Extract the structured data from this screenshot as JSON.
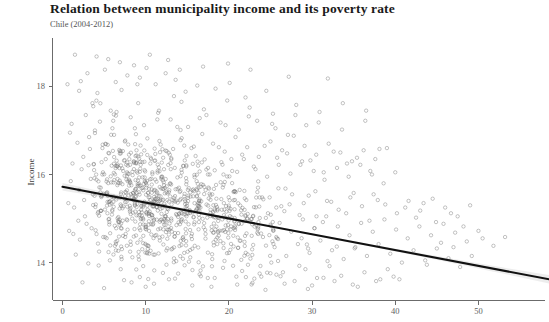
{
  "title": "Relation between municipality income and its poverty rate",
  "subtitle": "Chile (2004-2012)",
  "colors": {
    "point_stroke": "#6f6f6f",
    "fit_line": "#111111",
    "ci_band": "#8c8c8c",
    "axis": "#6b6b6b",
    "title_text": "#1a1a1a",
    "background": "#ffffff"
  },
  "axis_labels": {
    "y_title": "Income",
    "x_title": ""
  },
  "ticks": {
    "x": [
      "0",
      "10",
      "20",
      "30",
      "40",
      "50"
    ],
    "y": [
      "14",
      "16",
      "18"
    ]
  },
  "chart_data": {
    "type": "scatter",
    "title": "Relation between municipality income and its poverty rate",
    "subtitle": "Chile (2004-2012)",
    "xlabel": "",
    "ylabel": "Income",
    "xlim": [
      -1.2,
      58
    ],
    "ylim": [
      13.15,
      19.1
    ],
    "xticks": [
      0,
      10,
      20,
      30,
      40,
      50
    ],
    "yticks": [
      14,
      16,
      18
    ],
    "grid": false,
    "legend": null,
    "fit": {
      "type": "linear-regression",
      "label": "OLS fit with 95% confidence band",
      "x_start": 0.0,
      "x_end": 58.5,
      "y_start": 15.72,
      "y_end": 13.62,
      "slope": -0.0359,
      "intercept": 15.72,
      "ci_half_width_at_x_start": 0.085,
      "ci_half_width_at_mean": 0.022,
      "ci_half_width_at_x_end": 0.095
    },
    "points": [
      [
        1.5,
        18.72
      ],
      [
        3.0,
        18.3
      ],
      [
        4.2,
        17.85
      ],
      [
        0.6,
        18.05
      ],
      [
        2.2,
        18.12
      ],
      [
        5.1,
        18.38
      ],
      [
        6.4,
        18.1
      ],
      [
        3.6,
        17.62
      ],
      [
        7.8,
        18.25
      ],
      [
        8.6,
        18.48
      ],
      [
        9.3,
        18.2
      ],
      [
        10.1,
        18.42
      ],
      [
        11.2,
        18.05
      ],
      [
        12.4,
        18.3
      ],
      [
        7.1,
        17.92
      ],
      [
        5.8,
        17.45
      ],
      [
        13.6,
        18.15
      ],
      [
        14.8,
        17.88
      ],
      [
        16.2,
        18.02
      ],
      [
        18.4,
        17.95
      ],
      [
        20.1,
        18.08
      ],
      [
        22.0,
        17.75
      ],
      [
        24.5,
        17.9
      ],
      [
        2.8,
        17.35
      ],
      [
        4.5,
        17.2
      ],
      [
        6.0,
        17.05
      ],
      [
        8.2,
        17.3
      ],
      [
        9.8,
        17.12
      ],
      [
        11.5,
        17.4
      ],
      [
        13.0,
        17.25
      ],
      [
        15.1,
        17.08
      ],
      [
        17.3,
        17.35
      ],
      [
        19.0,
        17.18
      ],
      [
        21.2,
        17.02
      ],
      [
        23.4,
        17.22
      ],
      [
        25.6,
        17.05
      ],
      [
        27.1,
        16.9
      ],
      [
        29.3,
        17.12
      ],
      [
        0.9,
        16.95
      ],
      [
        1.8,
        16.72
      ],
      [
        3.2,
        16.85
      ],
      [
        4.8,
        16.6
      ],
      [
        6.2,
        16.9
      ],
      [
        7.5,
        16.75
      ],
      [
        8.9,
        16.55
      ],
      [
        10.2,
        16.82
      ],
      [
        11.8,
        16.68
      ],
      [
        12.9,
        16.45
      ],
      [
        14.2,
        16.78
      ],
      [
        15.5,
        16.6
      ],
      [
        16.8,
        16.92
      ],
      [
        18.1,
        16.7
      ],
      [
        19.5,
        16.52
      ],
      [
        20.8,
        16.85
      ],
      [
        22.2,
        16.62
      ],
      [
        23.6,
        16.4
      ],
      [
        25.0,
        16.75
      ],
      [
        26.4,
        16.55
      ],
      [
        27.8,
        16.88
      ],
      [
        29.1,
        16.65
      ],
      [
        30.5,
        16.45
      ],
      [
        32.0,
        16.7
      ],
      [
        33.4,
        16.5
      ],
      [
        34.8,
        16.3
      ],
      [
        36.2,
        16.55
      ],
      [
        37.6,
        16.35
      ],
      [
        39.0,
        16.6
      ],
      [
        1.2,
        16.25
      ],
      [
        2.5,
        16.4
      ],
      [
        3.8,
        16.1
      ],
      [
        5.2,
        16.35
      ],
      [
        6.6,
        16.18
      ],
      [
        8.0,
        16.45
      ],
      [
        9.4,
        16.22
      ],
      [
        10.8,
        16.05
      ],
      [
        12.1,
        16.38
      ],
      [
        13.5,
        16.15
      ],
      [
        14.9,
        16.42
      ],
      [
        16.3,
        16.2
      ],
      [
        17.7,
        16.0
      ],
      [
        19.1,
        16.28
      ],
      [
        20.4,
        16.08
      ],
      [
        21.8,
        16.35
      ],
      [
        23.2,
        16.12
      ],
      [
        24.6,
        15.95
      ],
      [
        26.0,
        16.22
      ],
      [
        27.4,
        16.02
      ],
      [
        28.8,
        16.3
      ],
      [
        30.2,
        16.08
      ],
      [
        31.5,
        15.88
      ],
      [
        33.0,
        16.15
      ],
      [
        34.4,
        15.95
      ],
      [
        35.8,
        16.22
      ],
      [
        37.2,
        16.0
      ],
      [
        38.6,
        15.8
      ],
      [
        40.0,
        16.05
      ],
      [
        1.0,
        15.85
      ],
      [
        2.0,
        15.65
      ],
      [
        3.4,
        15.9
      ],
      [
        4.6,
        15.7
      ],
      [
        5.9,
        15.5
      ],
      [
        7.2,
        15.78
      ],
      [
        8.5,
        15.58
      ],
      [
        9.9,
        15.85
      ],
      [
        11.3,
        15.62
      ],
      [
        12.6,
        15.42
      ],
      [
        14.0,
        15.7
      ],
      [
        15.4,
        15.5
      ],
      [
        16.7,
        15.78
      ],
      [
        18.0,
        15.55
      ],
      [
        19.4,
        15.35
      ],
      [
        20.7,
        15.62
      ],
      [
        22.1,
        15.42
      ],
      [
        23.5,
        15.7
      ],
      [
        24.9,
        15.48
      ],
      [
        26.3,
        15.28
      ],
      [
        27.6,
        15.55
      ],
      [
        29.0,
        15.35
      ],
      [
        30.4,
        15.62
      ],
      [
        31.8,
        15.4
      ],
      [
        33.2,
        15.2
      ],
      [
        34.6,
        15.48
      ],
      [
        36.0,
        15.28
      ],
      [
        37.4,
        15.55
      ],
      [
        38.8,
        15.32
      ],
      [
        40.2,
        15.12
      ],
      [
        41.6,
        15.4
      ],
      [
        43.0,
        15.18
      ],
      [
        44.5,
        15.45
      ],
      [
        46.0,
        15.25
      ],
      [
        47.5,
        15.05
      ],
      [
        49.0,
        15.3
      ],
      [
        1.4,
        15.25
      ],
      [
        2.7,
        15.05
      ],
      [
        4.0,
        15.32
      ],
      [
        5.4,
        15.12
      ],
      [
        6.8,
        14.92
      ],
      [
        8.1,
        15.2
      ],
      [
        9.5,
        15.0
      ],
      [
        10.9,
        15.28
      ],
      [
        12.3,
        15.05
      ],
      [
        13.7,
        14.85
      ],
      [
        15.0,
        15.12
      ],
      [
        16.4,
        14.92
      ],
      [
        17.8,
        15.2
      ],
      [
        19.2,
        14.98
      ],
      [
        20.6,
        14.78
      ],
      [
        22.0,
        15.05
      ],
      [
        23.3,
        14.85
      ],
      [
        24.7,
        15.12
      ],
      [
        26.1,
        14.9
      ],
      [
        27.5,
        14.7
      ],
      [
        28.9,
        14.98
      ],
      [
        30.3,
        14.78
      ],
      [
        31.7,
        15.05
      ],
      [
        33.1,
        14.82
      ],
      [
        34.5,
        14.62
      ],
      [
        35.9,
        14.9
      ],
      [
        37.3,
        14.7
      ],
      [
        38.7,
        14.98
      ],
      [
        40.1,
        14.75
      ],
      [
        41.5,
        14.55
      ],
      [
        42.9,
        14.82
      ],
      [
        44.3,
        14.62
      ],
      [
        45.8,
        14.88
      ],
      [
        47.2,
        14.68
      ],
      [
        48.6,
        14.48
      ],
      [
        50.0,
        14.72
      ],
      [
        0.8,
        14.72
      ],
      [
        2.1,
        14.52
      ],
      [
        3.5,
        14.78
      ],
      [
        4.9,
        14.58
      ],
      [
        6.3,
        14.38
      ],
      [
        7.6,
        14.65
      ],
      [
        9.0,
        14.45
      ],
      [
        10.4,
        14.72
      ],
      [
        11.7,
        14.5
      ],
      [
        13.1,
        14.3
      ],
      [
        14.5,
        14.58
      ],
      [
        15.9,
        14.38
      ],
      [
        17.2,
        14.65
      ],
      [
        18.6,
        14.42
      ],
      [
        20.0,
        14.22
      ],
      [
        21.4,
        14.5
      ],
      [
        22.8,
        14.3
      ],
      [
        24.1,
        14.58
      ],
      [
        25.5,
        14.35
      ],
      [
        26.9,
        14.15
      ],
      [
        28.3,
        14.42
      ],
      [
        29.7,
        14.22
      ],
      [
        31.0,
        14.5
      ],
      [
        32.4,
        14.28
      ],
      [
        33.8,
        14.08
      ],
      [
        35.2,
        14.35
      ],
      [
        36.6,
        14.15
      ],
      [
        38.0,
        14.42
      ],
      [
        39.4,
        14.2
      ],
      [
        40.8,
        14.0
      ],
      [
        42.2,
        14.28
      ],
      [
        43.6,
        14.05
      ],
      [
        45.0,
        14.32
      ],
      [
        46.4,
        14.1
      ],
      [
        47.8,
        13.9
      ],
      [
        49.2,
        14.15
      ],
      [
        1.6,
        14.18
      ],
      [
        3.1,
        13.98
      ],
      [
        4.4,
        14.25
      ],
      [
        5.7,
        14.05
      ],
      [
        7.0,
        13.85
      ],
      [
        8.4,
        14.12
      ],
      [
        9.7,
        13.92
      ],
      [
        11.1,
        14.18
      ],
      [
        12.5,
        13.95
      ],
      [
        13.9,
        13.75
      ],
      [
        15.2,
        14.02
      ],
      [
        16.6,
        13.82
      ],
      [
        18.0,
        14.08
      ],
      [
        19.3,
        13.88
      ],
      [
        20.9,
        13.68
      ],
      [
        22.3,
        13.95
      ],
      [
        23.7,
        13.75
      ],
      [
        25.1,
        14.0
      ],
      [
        26.5,
        13.78
      ],
      [
        27.9,
        13.58
      ],
      [
        29.2,
        13.85
      ],
      [
        30.6,
        13.65
      ],
      [
        32.1,
        13.92
      ],
      [
        33.5,
        13.7
      ],
      [
        34.9,
        13.5
      ],
      [
        36.3,
        13.78
      ],
      [
        37.7,
        13.58
      ],
      [
        39.1,
        13.85
      ],
      [
        40.5,
        13.62
      ],
      [
        2.4,
        13.55
      ],
      [
        5.0,
        13.42
      ],
      [
        7.4,
        13.6
      ],
      [
        10.0,
        13.45
      ],
      [
        12.8,
        13.62
      ],
      [
        15.6,
        13.48
      ],
      [
        18.3,
        13.65
      ],
      [
        21.0,
        13.5
      ],
      [
        23.9,
        13.68
      ],
      [
        26.7,
        13.52
      ],
      [
        29.5,
        13.4
      ],
      [
        32.7,
        13.58
      ],
      [
        35.5,
        13.45
      ],
      [
        38.2,
        13.62
      ],
      [
        3.3,
        16.58
      ],
      [
        5.6,
        16.48
      ],
      [
        7.9,
        16.68
      ],
      [
        10.6,
        16.38
      ],
      [
        13.3,
        16.58
      ],
      [
        16.0,
        16.42
      ],
      [
        18.8,
        16.62
      ],
      [
        21.6,
        16.45
      ],
      [
        24.3,
        16.65
      ],
      [
        27.0,
        16.48
      ],
      [
        29.8,
        16.32
      ],
      [
        32.6,
        16.52
      ],
      [
        35.4,
        16.38
      ],
      [
        38.1,
        16.58
      ],
      [
        2.6,
        15.42
      ],
      [
        5.3,
        15.58
      ],
      [
        7.7,
        15.38
      ],
      [
        10.3,
        15.58
      ],
      [
        13.2,
        15.42
      ],
      [
        15.8,
        15.62
      ],
      [
        18.5,
        15.45
      ],
      [
        21.3,
        15.65
      ],
      [
        24.0,
        15.48
      ],
      [
        26.8,
        15.68
      ],
      [
        29.6,
        15.52
      ],
      [
        32.3,
        15.38
      ],
      [
        35.0,
        15.58
      ],
      [
        37.9,
        15.42
      ],
      [
        1.9,
        14.95
      ],
      [
        4.3,
        15.15
      ],
      [
        6.7,
        14.95
      ],
      [
        9.2,
        15.15
      ],
      [
        11.9,
        14.98
      ],
      [
        14.6,
        15.18
      ],
      [
        17.4,
        15.02
      ],
      [
        20.2,
        15.22
      ],
      [
        22.9,
        15.05
      ],
      [
        25.7,
        15.25
      ],
      [
        28.5,
        15.08
      ],
      [
        31.3,
        14.92
      ],
      [
        34.1,
        15.12
      ],
      [
        36.9,
        14.95
      ],
      [
        2.3,
        16.12
      ],
      [
        4.7,
        16.28
      ],
      [
        7.3,
        16.08
      ],
      [
        9.6,
        16.28
      ],
      [
        12.2,
        16.12
      ],
      [
        14.7,
        16.32
      ],
      [
        17.5,
        16.15
      ],
      [
        20.3,
        16.35
      ],
      [
        23.0,
        16.18
      ],
      [
        25.8,
        16.38
      ],
      [
        28.6,
        16.22
      ],
      [
        31.4,
        16.05
      ],
      [
        34.2,
        16.25
      ],
      [
        37.0,
        16.08
      ],
      [
        3.7,
        17.55
      ],
      [
        6.5,
        17.42
      ],
      [
        9.1,
        17.62
      ],
      [
        11.6,
        17.45
      ],
      [
        14.3,
        17.65
      ],
      [
        17.0,
        17.48
      ],
      [
        19.8,
        17.68
      ],
      [
        22.5,
        17.52
      ],
      [
        25.3,
        17.38
      ],
      [
        28.1,
        17.58
      ],
      [
        30.9,
        17.42
      ],
      [
        33.7,
        17.62
      ],
      [
        36.5,
        17.45
      ],
      [
        4.1,
        18.68
      ],
      [
        6.9,
        18.55
      ],
      [
        12.7,
        18.6
      ],
      [
        16.9,
        18.45
      ],
      [
        22.6,
        18.38
      ],
      [
        27.2,
        18.22
      ],
      [
        31.9,
        18.18
      ],
      [
        1.1,
        17.15
      ],
      [
        3.9,
        17.0
      ],
      [
        6.1,
        17.22
      ],
      [
        8.7,
        17.05
      ],
      [
        11.4,
        17.25
      ],
      [
        13.8,
        17.08
      ],
      [
        16.5,
        17.28
      ],
      [
        19.6,
        17.12
      ],
      [
        22.4,
        17.32
      ],
      [
        25.2,
        17.15
      ],
      [
        28.0,
        17.35
      ],
      [
        30.8,
        17.18
      ],
      [
        33.6,
        17.02
      ],
      [
        36.4,
        17.22
      ],
      [
        0.7,
        15.35
      ],
      [
        1.3,
        14.65
      ],
      [
        2.9,
        14.88
      ],
      [
        42.5,
        15.02
      ],
      [
        44.9,
        14.92
      ],
      [
        46.7,
        15.12
      ],
      [
        48.2,
        14.82
      ],
      [
        50.5,
        14.55
      ],
      [
        51.8,
        14.38
      ],
      [
        53.2,
        14.58
      ],
      [
        41.2,
        15.25
      ],
      [
        43.4,
        15.35
      ],
      [
        45.5,
        14.45
      ],
      [
        47.0,
        14.35
      ],
      [
        8.3,
        13.55
      ],
      [
        11.0,
        13.52
      ],
      [
        17.9,
        13.45
      ],
      [
        24.4,
        13.38
      ],
      [
        30.0,
        13.48
      ],
      [
        39.8,
        13.68
      ],
      [
        43.8,
        13.95
      ],
      [
        5.5,
        18.62
      ],
      [
        10.5,
        18.72
      ],
      [
        14.1,
        18.38
      ],
      [
        19.9,
        18.52
      ],
      [
        9.0,
        18.05
      ],
      [
        13.4,
        17.78
      ],
      [
        2.0,
        17.9
      ]
    ]
  }
}
